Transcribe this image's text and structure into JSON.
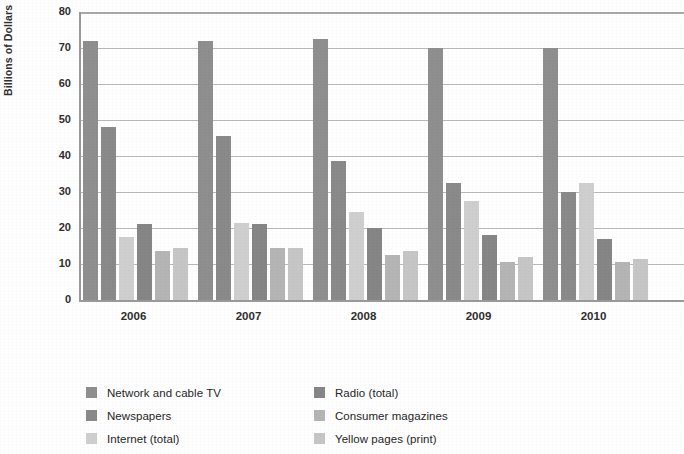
{
  "chart_data": {
    "type": "bar",
    "title": "",
    "subtitle": "",
    "xlabel": "",
    "ylabel": "Billions of Dollars",
    "categories": [
      "2006",
      "2007",
      "2008",
      "2009",
      "2010"
    ],
    "ylim": [
      0,
      80
    ],
    "yticks": [
      0,
      10,
      20,
      30,
      40,
      50,
      60,
      70,
      80
    ],
    "ytick_labels": [
      "0",
      "10",
      "20",
      "30",
      "40",
      "50",
      "60",
      "70",
      "80"
    ],
    "grid": true,
    "grid_axis": "y",
    "legend_position": "bottom",
    "legend_columns": 2,
    "bar_group_order": [
      "Network and cable TV",
      "Newspapers",
      "Internet (total)",
      "Radio (total)",
      "Consumer magazines",
      "Yellow pages (print)"
    ],
    "series": [
      {
        "name": "Network and cable TV",
        "color": "#8f8f8f",
        "values": [
          72,
          72,
          72.5,
          70,
          70
        ]
      },
      {
        "name": "Newspapers",
        "color": "#8a8a8a",
        "values": [
          48,
          45.5,
          38.5,
          32.5,
          30
        ]
      },
      {
        "name": "Internet (total)",
        "color": "#cfcfcf",
        "values": [
          17.5,
          21.5,
          24.5,
          27.5,
          32.5
        ]
      },
      {
        "name": "Radio (total)",
        "color": "#868686",
        "values": [
          21,
          21,
          20,
          18,
          17
        ]
      },
      {
        "name": "Consumer magazines",
        "color": "#b5b5b5",
        "values": [
          13.5,
          14.5,
          12.5,
          10.5,
          10.5
        ]
      },
      {
        "name": "Yellow pages (print)",
        "color": "#c6c6c6",
        "values": [
          14.5,
          14.5,
          13.5,
          12,
          11.5
        ]
      }
    ]
  },
  "axes": {
    "y_axis_title": "Billions of Dollars"
  }
}
